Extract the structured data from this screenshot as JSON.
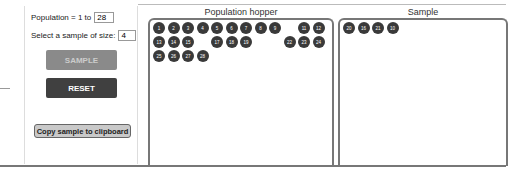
{
  "controls": {
    "population_label": "Population = 1 to",
    "population_value": "28",
    "sample_size_label": "Select a sample of size:",
    "sample_size_value": "4",
    "sample_button": "SAMPLE",
    "reset_button": "RESET",
    "copy_button": "Copy sample to clipboard"
  },
  "hopper": {
    "title": "Population hopper",
    "balls": [
      "1",
      "2",
      "3",
      "4",
      "5",
      "6",
      "7",
      "8",
      "9",
      "",
      "11",
      "12",
      "13",
      "14",
      "15",
      "",
      "17",
      "18",
      "19",
      "",
      "",
      "22",
      "23",
      "24",
      "25",
      "26",
      "27",
      "28"
    ]
  },
  "sample": {
    "title": "Sample",
    "balls": [
      "20",
      "16",
      "21",
      "10"
    ]
  }
}
